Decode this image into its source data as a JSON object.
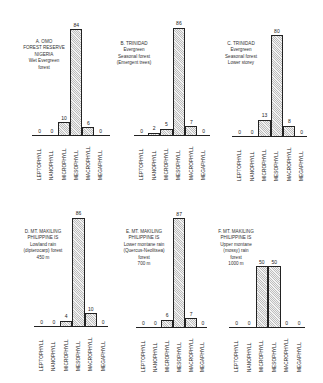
{
  "chart_data": [
    {
      "type": "bar",
      "title": "A. OMO FOREST RESERVE NIGERIA Wet Evergreen forest",
      "caption_lines": [
        "A. OMO",
        "FOREST RESERVE",
        "NIGERIA",
        "Wet Evergreen",
        "forest"
      ],
      "categories": [
        "LEPTOPHYLL",
        "NANOPHYLL",
        "MICROPHYLL",
        "MESOPHYLL",
        "MACROPHYLL",
        "MEGAPHYLL"
      ],
      "values": [
        0,
        0,
        10,
        84,
        6,
        0
      ],
      "value_labels": [
        "0",
        "0",
        "10",
        "84",
        "6",
        "0"
      ],
      "xlabel": "",
      "ylabel": "",
      "ylim": [
        0,
        100
      ],
      "grid": false,
      "legend": "none"
    },
    {
      "type": "bar",
      "title": "B. TRINIDAD Evergreen Seasonal forest (Emergent trees)",
      "caption_lines": [
        "B. TRINIDAD",
        "Evergreen",
        "Seasonal forest",
        "(Emergent trees)"
      ],
      "categories": [
        "LEPTOPHYLL",
        "NANOPHYLL",
        "MICROPHYLL",
        "MESOPHYLL",
        "MACROPHYLL",
        "MEGAPHYLL"
      ],
      "values": [
        0,
        2,
        5,
        86,
        7,
        0
      ],
      "value_labels": [
        "0",
        "2",
        "5",
        "86",
        "7",
        "0"
      ],
      "xlabel": "",
      "ylabel": "",
      "ylim": [
        0,
        100
      ],
      "grid": false,
      "legend": "none"
    },
    {
      "type": "bar",
      "title": "C. TRINIDAD Evergreen Seasonal forest Lower storey",
      "caption_lines": [
        "C. TRINIDAD",
        "Evergreen",
        "Seasonal forest",
        "Lower storey"
      ],
      "categories": [
        "LEPTOPHYLL",
        "NANOPHYLL",
        "MICROPHYLL",
        "MESOPHYLL",
        "MACROPHYLL",
        "MEGAPHYLL"
      ],
      "values": [
        0,
        0,
        13,
        80,
        8,
        0
      ],
      "value_labels": [
        "0",
        "0",
        "13",
        "80",
        "8",
        "0"
      ],
      "xlabel": "",
      "ylabel": "",
      "ylim": [
        0,
        100
      ],
      "grid": false,
      "legend": "none"
    },
    {
      "type": "bar",
      "title": "D. MT. MAKILING PHILIPPINE IS Lowland rain (dipterocarp) forest 450 m",
      "caption_lines": [
        "D. MT. MAKILING",
        "PHILIPPINE IS",
        "Lowland rain",
        "(dipterocarp) forest",
        "450 m"
      ],
      "categories": [
        "LEPTOPHYLL",
        "NANOPHYLL",
        "MICROPHYLL",
        "MESOPHYLL",
        "MACROPHYLL",
        "MEGAPHYLL"
      ],
      "values": [
        0,
        0,
        4,
        86,
        10,
        0
      ],
      "value_labels": [
        "0",
        "0",
        "4",
        "86",
        "10",
        "0"
      ],
      "xlabel": "",
      "ylabel": "",
      "ylim": [
        0,
        100
      ],
      "grid": false,
      "legend": "none"
    },
    {
      "type": "bar",
      "title": "E. MT. MAKILING PHILIPPINE IS Lower montane rain (Quercus-Neolitsea) forest 700 m",
      "caption_lines": [
        "E. MT. MAKILING",
        "PHILIPPINE IS",
        "Lower montane rain",
        "(Quercus-Neolitsea)",
        "forest",
        "700 m"
      ],
      "categories": [
        "LEPTOPHYLL",
        "NANOPHYLL",
        "MICROPHYLL",
        "MESOPHYLL",
        "MACROPHYLL",
        "MEGAPHYLL"
      ],
      "values": [
        0,
        0,
        6,
        87,
        7,
        0
      ],
      "value_labels": [
        "0",
        "0",
        "6",
        "87",
        "7",
        "0"
      ],
      "xlabel": "",
      "ylabel": "",
      "ylim": [
        0,
        100
      ],
      "grid": false,
      "legend": "none"
    },
    {
      "type": "bar",
      "title": "F. MT. MAKILING PHILIPPINE IS Upper montane (mossy) rain forest 1000 m",
      "caption_lines": [
        "F. MT. MAKILING",
        "PHILIPPINE IS",
        "Upper montane",
        "(mossy) rain",
        "forest",
        "1000 m"
      ],
      "categories": [
        "LEPTOPHYLL",
        "NANOPHYLL",
        "MICROPHYLL",
        "MESOPHYLL",
        "MACROPHYLL",
        "MEGAPHYLL"
      ],
      "values": [
        0,
        0,
        50,
        50,
        0,
        0
      ],
      "value_labels": [
        "0",
        "0",
        "50",
        "50",
        "0",
        "0"
      ],
      "xlabel": "",
      "ylabel": "",
      "ylim": [
        0,
        100
      ],
      "grid": false,
      "legend": "none"
    }
  ]
}
